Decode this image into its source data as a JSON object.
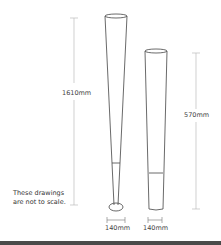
{
  "diagram": {
    "tall_item": {
      "height_label": "1610mm",
      "base_label": "140mm"
    },
    "short_item": {
      "height_label": "570mm",
      "base_label": "140mm"
    },
    "note_line1": "These drawings",
    "note_line2": "are not to scale."
  }
}
